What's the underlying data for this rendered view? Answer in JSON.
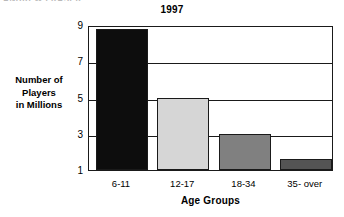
{
  "artifact_text": "ANDREW FRASER",
  "chart_data": {
    "type": "bar",
    "title": "1997",
    "xlabel": "Age Groups",
    "ylabel": "Number of\nPlayers\nin Millions",
    "ylabel_lines": [
      "Number of",
      "Players",
      "in Millions"
    ],
    "categories": [
      "6-11",
      "12-17",
      "18-34",
      "35- over"
    ],
    "values": [
      8.8,
      5.0,
      3.0,
      1.6
    ],
    "bar_colors": [
      "#0d0d0d",
      "#d6d6d6",
      "#808080",
      "#545454"
    ],
    "ylim": [
      1,
      9
    ],
    "yticks": [
      1,
      3,
      5,
      7,
      9
    ],
    "ytick_labels": [
      "1",
      "3",
      "5",
      "7",
      "9"
    ],
    "grid": true,
    "grid_axis": "y",
    "legend": "none",
    "axis_color": "#1a1a1a",
    "background": "#ffffff"
  }
}
